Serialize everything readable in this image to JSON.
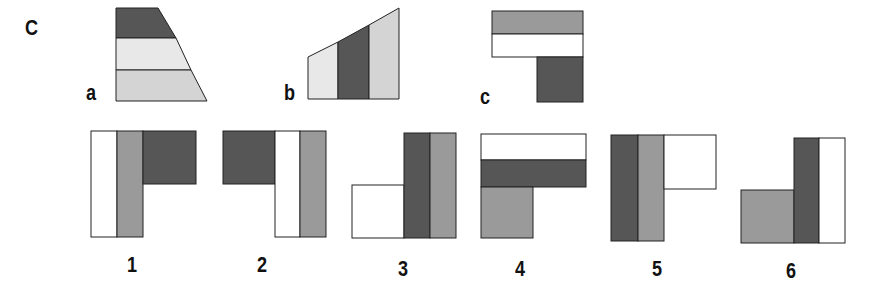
{
  "puzzle": {
    "title": "C",
    "colors": {
      "dark": "#565656",
      "medium": "#9a9a9a",
      "light": "#d4d4d4",
      "very_light": "#e8e8e8",
      "white": "#ffffff",
      "stroke": "#222222"
    },
    "pieces": [
      {
        "label": "a",
        "description": "trapezoid with three horizontal bands: dark (top), very light (middle), light (bottom)"
      },
      {
        "label": "b",
        "description": "trapezoid with three vertical bands: very light (left), dark (middle), light (right)"
      },
      {
        "label": "c",
        "description": "L shape: medium band over white band, dark block hanging below right"
      }
    ],
    "options": [
      {
        "label": "1",
        "description": "white and medium vertical strips, dark block top-right"
      },
      {
        "label": "2",
        "description": "dark block top-left, white and medium vertical strips"
      },
      {
        "label": "3",
        "description": "white block bottom-left, dark and medium vertical strips"
      },
      {
        "label": "4",
        "description": "white and dark horizontal strips, medium block bottom-left"
      },
      {
        "label": "5",
        "description": "dark and medium vertical strips, white block top-right"
      },
      {
        "label": "6",
        "description": "medium block bottom-left, dark and white vertical strips"
      }
    ]
  }
}
